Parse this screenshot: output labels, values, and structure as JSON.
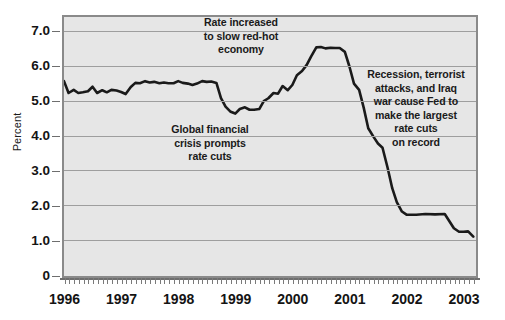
{
  "chart_data": {
    "type": "line",
    "title": "",
    "xlabel": "",
    "ylabel": "Percent",
    "xlim": [
      1996.0,
      2003.2
    ],
    "ylim": [
      0,
      7.4
    ],
    "yticks": [
      "0",
      "1.0",
      "2.0",
      "3.0",
      "4.0",
      "5.0",
      "6.0",
      "7.0"
    ],
    "ytick_values": [
      0,
      1.0,
      2.0,
      3.0,
      4.0,
      5.0,
      6.0,
      7.0
    ],
    "xticks": [
      "1996",
      "1997",
      "1998",
      "1999",
      "2000",
      "2001",
      "2002",
      "2003"
    ],
    "xtick_values": [
      1996,
      1997,
      1998,
      1999,
      2000,
      2001,
      2002,
      2003
    ],
    "grid": true,
    "legend": "none",
    "series": [
      {
        "name": "Federal funds rate",
        "color": "#1a1a1a",
        "x": [
          1996.0,
          1996.08,
          1996.17,
          1996.25,
          1996.33,
          1996.42,
          1996.5,
          1996.58,
          1996.67,
          1996.75,
          1996.83,
          1996.92,
          1997.0,
          1997.08,
          1997.17,
          1997.25,
          1997.33,
          1997.42,
          1997.5,
          1997.58,
          1997.67,
          1997.75,
          1997.83,
          1997.92,
          1998.0,
          1998.08,
          1998.17,
          1998.25,
          1998.33,
          1998.42,
          1998.5,
          1998.58,
          1998.67,
          1998.75,
          1998.83,
          1998.92,
          1999.0,
          1999.08,
          1999.17,
          1999.25,
          1999.33,
          1999.42,
          1999.5,
          1999.58,
          1999.67,
          1999.75,
          1999.83,
          1999.92,
          2000.0,
          2000.08,
          2000.17,
          2000.25,
          2000.33,
          2000.42,
          2000.5,
          2000.58,
          2000.67,
          2000.75,
          2000.83,
          2000.92,
          2001.0,
          2001.08,
          2001.17,
          2001.25,
          2001.33,
          2001.42,
          2001.5,
          2001.58,
          2001.67,
          2001.75,
          2001.83,
          2001.92,
          2002.0,
          2002.17,
          2002.33,
          2002.5,
          2002.67,
          2002.83,
          2002.92,
          2003.0,
          2003.08,
          2003.17
        ],
        "y": [
          5.56,
          5.22,
          5.31,
          5.22,
          5.24,
          5.27,
          5.4,
          5.22,
          5.3,
          5.24,
          5.31,
          5.29,
          5.25,
          5.19,
          5.39,
          5.51,
          5.5,
          5.56,
          5.52,
          5.54,
          5.5,
          5.52,
          5.5,
          5.5,
          5.56,
          5.51,
          5.49,
          5.45,
          5.49,
          5.56,
          5.54,
          5.55,
          5.51,
          5.07,
          4.83,
          4.68,
          4.63,
          4.76,
          4.81,
          4.74,
          4.74,
          4.76,
          4.99,
          5.07,
          5.22,
          5.2,
          5.42,
          5.3,
          5.45,
          5.73,
          5.85,
          6.02,
          6.27,
          6.53,
          6.54,
          6.5,
          6.52,
          6.51,
          6.51,
          6.4,
          5.98,
          5.49,
          5.31,
          4.8,
          4.21,
          3.97,
          3.77,
          3.65,
          3.07,
          2.49,
          2.09,
          1.82,
          1.73,
          1.73,
          1.75,
          1.74,
          1.75,
          1.34,
          1.24,
          1.24,
          1.25,
          1.1
        ]
      }
    ],
    "annotations": [
      {
        "id": "rate-increase",
        "lines": [
          "Rate increased",
          "to slow red-hot",
          "economy"
        ]
      },
      {
        "id": "global-crisis",
        "lines": [
          "Global financial",
          "crisis prompts",
          "rate cuts"
        ]
      },
      {
        "id": "recession",
        "lines": [
          "Recession, terrorist",
          "attacks, and Iraq",
          "war cause Fed to",
          "make the largest",
          "rate cuts",
          "on record"
        ]
      }
    ],
    "colors": {
      "plot_background": "#e6e6e6",
      "plot_border": "#8a8a8a",
      "gridline": "#9e9e9e",
      "line": "#1a1a1a",
      "text": "#141414",
      "page_background": "#ffffff"
    }
  }
}
